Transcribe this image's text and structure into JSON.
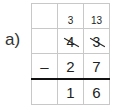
{
  "problem": {
    "label": "a)",
    "operation": "subtraction",
    "rows": {
      "carry": [
        "",
        "3",
        "13"
      ],
      "minuend": [
        "",
        "4",
        "3"
      ],
      "minuend_struck": [
        false,
        true,
        true
      ],
      "subtrahend": [
        "–",
        "2",
        "7"
      ],
      "result": [
        "",
        "1",
        "6"
      ]
    }
  },
  "colors": {
    "grid_line": "#c8c8c8",
    "result_line": "#111111",
    "text": "#222222"
  }
}
